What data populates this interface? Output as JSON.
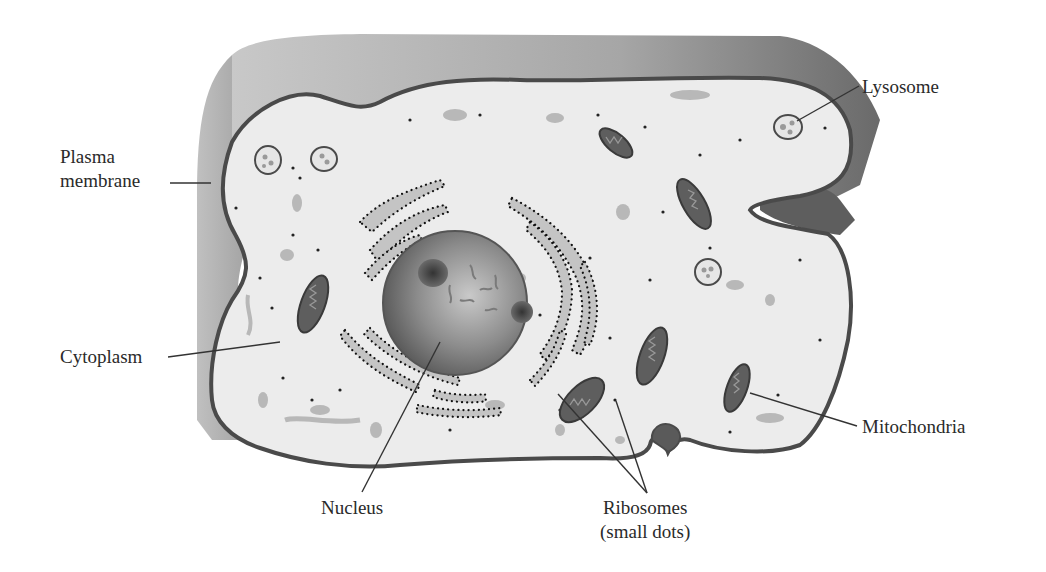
{
  "labels": {
    "plasma_membrane": [
      "Plasma",
      "membrane"
    ],
    "cytoplasm": "Cytoplasm",
    "lysosome": "Lysosome",
    "mitochondria": "Mitochondria",
    "nucleus": "Nucleus",
    "ribosomes": [
      "Ribosomes",
      "(small dots)"
    ]
  },
  "colors": {
    "background": "#ffffff",
    "cytoplasm_fill": "#ebebeb",
    "membrane_stroke": "#4a4a4a",
    "cell_top_shade": "#a8a8a8",
    "cell_top_shade_dark": "#6e6e6e",
    "er_fill": "#c4c4c4",
    "nucleus_fill": "#7a7a7a",
    "mitochondria_fill": "#5a5a5a",
    "leader_line": "#333333",
    "text": "#2a2a2a"
  }
}
